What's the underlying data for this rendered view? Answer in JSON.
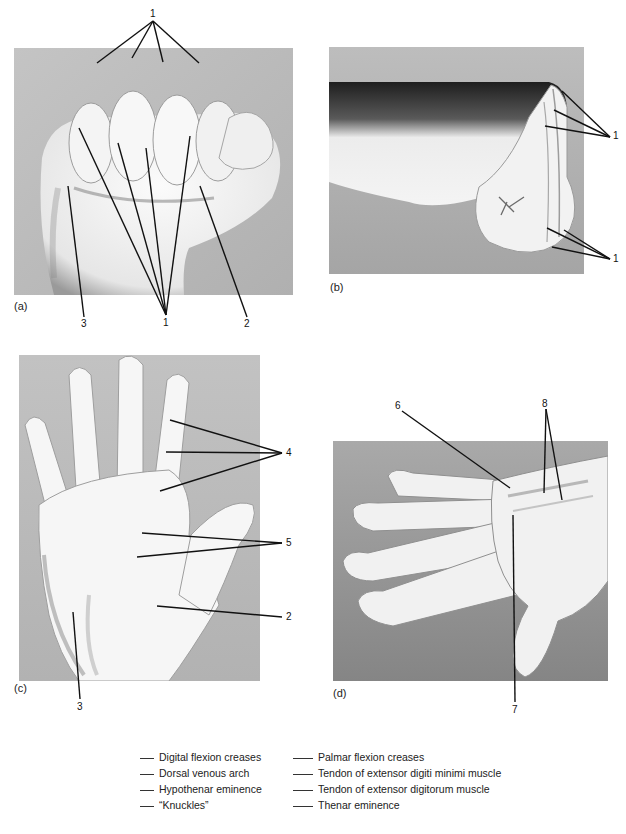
{
  "panels": [
    {
      "id": "a",
      "label": "(a)",
      "view": "Clenched fist, anterior view"
    },
    {
      "id": "b",
      "label": "(b)",
      "view": "Clenched fist, lateral view"
    },
    {
      "id": "c",
      "label": "(c)",
      "view": "Open palm, anterior view"
    },
    {
      "id": "d",
      "label": "(d)",
      "view": "Dorsum of hand, lateral view"
    }
  ],
  "callouts": {
    "a_top": "1",
    "a_bottom_left": "3",
    "a_bottom_mid": "1",
    "a_bottom_right": "2",
    "b_top": "1",
    "b_bottom": "1",
    "c_fingers": "4",
    "c_palm": "5",
    "c_thenar": "2",
    "c_hypothenar": "3",
    "d_tendon_minimi": "6",
    "d_venous": "7",
    "d_tendons": "8"
  },
  "legend": {
    "left": [
      "Digital flexion creases",
      "Dorsal venous arch",
      "Hypothenar eminence",
      "“Knuckles”"
    ],
    "right": [
      "Palmar flexion creases",
      "Tendon of extensor digiti minimi muscle",
      "Tendon of extensor digitorum muscle",
      "Thenar eminence"
    ]
  },
  "colors": {
    "background": "#ffffff",
    "photo_bg_light": "#b9b9b9",
    "photo_bg_dark": "#8f8f8f",
    "skin": "#f2f2f2",
    "leader_line": "#111111"
  }
}
